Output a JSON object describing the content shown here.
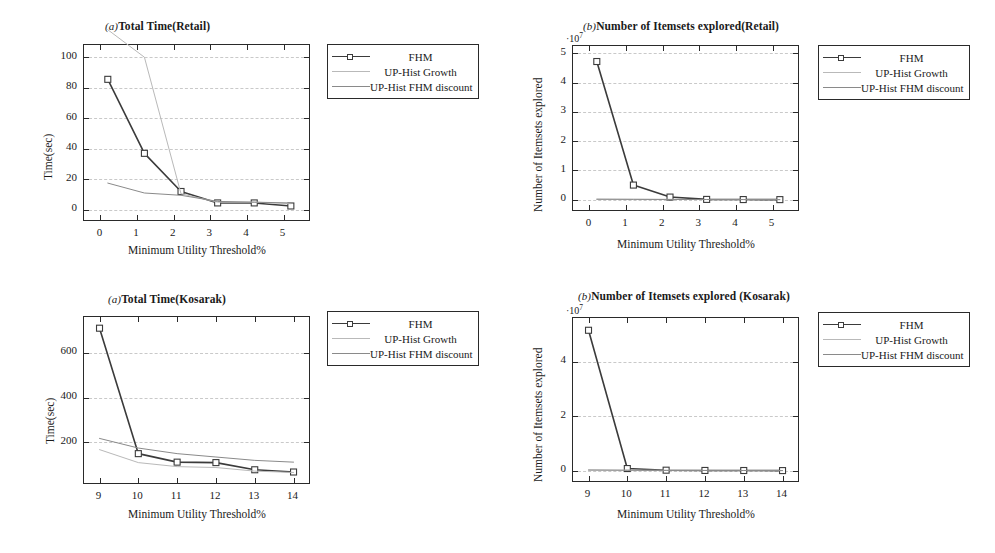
{
  "figure": {
    "background": "#ffffff",
    "axis_color": "#2a2a2a",
    "grid_color": "#c9c9c9"
  },
  "series_style": {
    "fhm": {
      "name": "FHM",
      "color": "#3b3b3b",
      "marker": "square",
      "width": 1.6
    },
    "uphist_growth": {
      "name": "UP-Hist Growth",
      "color": "#b9b9b9",
      "marker": "none",
      "width": 1.0
    },
    "uphist_fhm_discount": {
      "name": "UP-Hist FHM discount",
      "color": "#8a8a8a",
      "marker": "none",
      "width": 1.0
    }
  },
  "legend": {
    "entries": [
      {
        "label": "FHM",
        "key": "fhm"
      },
      {
        "label": "UP-Hist Growth",
        "key": "uphist_growth"
      },
      {
        "label": "UP-Hist FHM discount",
        "key": "uphist_fhm_discount"
      }
    ]
  },
  "panels": [
    {
      "id": "panel-0",
      "tag": "(a)",
      "title": "Total Time(Retail)",
      "chart_data": {
        "type": "line",
        "title": "(a)Total Time(Retail)",
        "xlabel": "Minimum Utility Threshold%",
        "ylabel": "Time(sec)",
        "xlim": [
          -0.45,
          5.75
        ],
        "ylim": [
          -8,
          108
        ],
        "xticks": [
          0,
          1,
          2,
          3,
          4,
          5
        ],
        "yticks": [
          0,
          20,
          40,
          60,
          80,
          100
        ],
        "grid": true,
        "legend_position": "outside-right-top",
        "x": [
          0.2,
          1.2,
          2.2,
          3.2,
          4.2,
          5.2
        ],
        "series": [
          {
            "name": "FHM",
            "key": "fhm",
            "values": [
              85.5,
              37.0,
              12.0,
              4.5,
              4.5,
              2.5
            ]
          },
          {
            "name": "UP-Hist Growth",
            "key": "uphist_growth",
            "values": [
              118.0,
              100.0,
              10.5,
              5.0,
              5.0,
              4.0
            ]
          },
          {
            "name": "UP-Hist FHM discount",
            "key": "uphist_fhm_discount",
            "values": [
              17.5,
              11.0,
              9.5,
              5.5,
              5.0,
              4.5
            ]
          }
        ]
      }
    },
    {
      "id": "panel-1",
      "tag": "(b)",
      "title": "Number of Itemsets explored(Retail)",
      "chart_data": {
        "type": "line",
        "title": "(b)Number of Itemsets explored(Retail)",
        "xlabel": "Minimum Utility Threshold%",
        "ylabel": "Number of Itemsets explored",
        "y_exponent_label": "10^7",
        "xlim": [
          -0.45,
          5.75
        ],
        "ylim": [
          -0.42,
          5.25
        ],
        "xticks": [
          0,
          1,
          2,
          3,
          4,
          5
        ],
        "yticks": [
          0,
          1,
          2,
          3,
          4,
          5
        ],
        "grid": true,
        "legend_position": "outside-right-top",
        "x": [
          0.2,
          1.2,
          2.2,
          3.2,
          4.2,
          5.2
        ],
        "series": [
          {
            "name": "FHM",
            "key": "fhm",
            "values": [
              4.72,
              0.5,
              0.09,
              0.01,
              0.005,
              0.003
            ]
          },
          {
            "name": "UP-Hist Growth",
            "key": "uphist_growth",
            "values": [
              0.02,
              0.015,
              0.01,
              0.007,
              0.005,
              0.003
            ]
          },
          {
            "name": "UP-Hist FHM discount",
            "key": "uphist_fhm_discount",
            "values": [
              0.015,
              0.012,
              0.009,
              0.006,
              0.004,
              0.003
            ]
          }
        ]
      }
    },
    {
      "id": "panel-2",
      "tag": "(a)",
      "title": "Total Time(Kosarak)",
      "chart_data": {
        "type": "line",
        "title": "(a)Total Time(Kosarak)",
        "xlabel": "Minimum Utility Threshold%",
        "ylabel": "Time(sec)",
        "xlim": [
          8.6,
          14.45
        ],
        "ylim": [
          10,
          760
        ],
        "xticks": [
          9,
          10,
          11,
          12,
          13,
          14
        ],
        "yticks": [
          200,
          400,
          600
        ],
        "grid": true,
        "legend_position": "outside-right-top",
        "x": [
          9,
          10,
          11,
          12,
          13,
          14
        ],
        "series": [
          {
            "name": "FHM",
            "key": "fhm",
            "values": [
              710,
              150,
              112,
              110,
              78,
              68
            ]
          },
          {
            "name": "UP-Hist Growth",
            "key": "uphist_growth",
            "values": [
              168,
              110,
              92,
              88,
              72,
              66
            ]
          },
          {
            "name": "UP-Hist FHM discount",
            "key": "uphist_fhm_discount",
            "values": [
              218,
              175,
              150,
              135,
              120,
              112
            ]
          }
        ]
      }
    },
    {
      "id": "panel-3",
      "tag": "(b)",
      "title": "Number of Itemsets explored (Kosarak)",
      "chart_data": {
        "type": "line",
        "title": "(b)Number of Itemsets explored (Kosarak)",
        "xlabel": "Minimum Utility Threshold%",
        "ylabel": "Number of Itemsets explored",
        "y_exponent_label": "10^7",
        "xlim": [
          8.6,
          14.45
        ],
        "ylim": [
          -0.45,
          5.6
        ],
        "xticks": [
          9,
          10,
          11,
          12,
          13,
          14
        ],
        "yticks": [
          0,
          2,
          4
        ],
        "grid": true,
        "legend_position": "outside-right-top",
        "x": [
          9,
          10,
          11,
          12,
          13,
          14
        ],
        "series": [
          {
            "name": "FHM",
            "key": "fhm",
            "values": [
              5.15,
              0.08,
              0.02,
              0.01,
              0.008,
              0.005
            ]
          },
          {
            "name": "UP-Hist Growth",
            "key": "uphist_growth",
            "values": [
              0.03,
              0.02,
              0.015,
              0.01,
              0.008,
              0.005
            ]
          },
          {
            "name": "UP-Hist FHM discount",
            "key": "uphist_fhm_discount",
            "values": [
              0.025,
              0.018,
              0.012,
              0.009,
              0.007,
              0.005
            ]
          }
        ]
      }
    }
  ]
}
